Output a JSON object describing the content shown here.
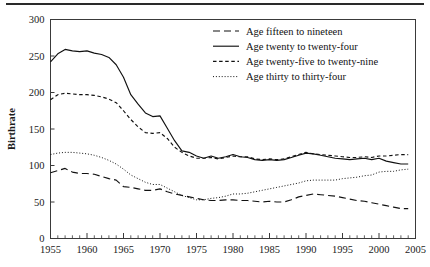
{
  "chart_data": {
    "type": "line",
    "title": "",
    "xlabel": "",
    "ylabel": "Birthrate",
    "xlim": [
      1955,
      2005
    ],
    "ylim": [
      0,
      300
    ],
    "yticks": [
      0,
      50,
      100,
      150,
      200,
      250,
      300
    ],
    "xticks": [
      1955,
      1960,
      1965,
      1970,
      1975,
      1980,
      1985,
      1990,
      1995,
      2000,
      2005
    ],
    "xtick_labels": [
      "1955",
      "1960",
      "1965",
      "1970",
      "1975",
      "1980",
      "1985",
      "1990",
      "1995",
      "2000",
      "2005"
    ],
    "ytick_labels": [
      "0",
      "50",
      "100",
      "150",
      "200",
      "250",
      "300"
    ],
    "minor_xtick_interval": 1,
    "grid": false,
    "legend_position": "top-right",
    "x": [
      1955,
      1956,
      1957,
      1958,
      1959,
      1960,
      1961,
      1962,
      1963,
      1964,
      1965,
      1966,
      1967,
      1968,
      1969,
      1970,
      1971,
      1972,
      1973,
      1974,
      1975,
      1976,
      1977,
      1978,
      1979,
      1980,
      1981,
      1982,
      1983,
      1984,
      1985,
      1986,
      1987,
      1988,
      1989,
      1990,
      1991,
      1992,
      1993,
      1994,
      1995,
      1996,
      1997,
      1998,
      1999,
      2000,
      2001,
      2002,
      2003,
      2004
    ],
    "series": [
      {
        "name": "Age fifteen to nineteen",
        "style": "long-dash",
        "values": [
          90,
          93,
          96,
          91,
          89,
          89,
          88,
          85,
          82,
          80,
          71,
          70,
          68,
          66,
          66,
          68,
          64,
          61,
          59,
          57,
          55,
          53,
          52,
          52,
          53,
          53,
          52,
          52,
          51,
          50,
          51,
          50,
          50,
          53,
          57,
          59,
          61,
          60,
          59,
          58,
          56,
          54,
          52,
          51,
          49,
          47,
          45,
          43,
          41,
          41
        ]
      },
      {
        "name": "Age twenty to twenty-four",
        "style": "solid",
        "values": [
          242,
          253,
          259,
          257,
          256,
          257,
          254,
          252,
          248,
          238,
          221,
          197,
          184,
          172,
          167,
          168,
          151,
          134,
          120,
          118,
          113,
          110,
          113,
          110,
          112,
          115,
          112,
          111,
          108,
          107,
          108,
          107,
          108,
          111,
          114,
          117,
          116,
          114,
          112,
          110,
          109,
          108,
          109,
          110,
          108,
          110,
          106,
          104,
          102,
          102
        ]
      },
      {
        "name": "Age twenty-five to twenty-nine",
        "style": "short-dash",
        "values": [
          190,
          197,
          199,
          198,
          197,
          197,
          196,
          194,
          191,
          186,
          175,
          163,
          153,
          145,
          144,
          145,
          137,
          125,
          118,
          113,
          110,
          110,
          111,
          109,
          111,
          113,
          112,
          112,
          109,
          108,
          109,
          108,
          109,
          112,
          115,
          118,
          116,
          115,
          114,
          113,
          112,
          111,
          111,
          112,
          111,
          113,
          113,
          114,
          115,
          115
        ]
      },
      {
        "name": "Age thirty to thirty-four",
        "style": "dotted",
        "values": [
          115,
          117,
          118,
          118,
          117,
          116,
          114,
          111,
          107,
          102,
          95,
          87,
          82,
          77,
          74,
          74,
          69,
          64,
          59,
          56,
          53,
          53,
          55,
          56,
          58,
          61,
          61,
          62,
          64,
          66,
          68,
          70,
          72,
          74,
          76,
          79,
          80,
          80,
          80,
          80,
          82,
          83,
          84,
          86,
          87,
          91,
          92,
          92,
          94,
          95
        ]
      }
    ]
  },
  "legend": {
    "items": [
      {
        "label": "Age fifteen to nineteen",
        "style": "long-dash"
      },
      {
        "label": "Age twenty to twenty-four",
        "style": "solid"
      },
      {
        "label": "Age twenty-five to twenty-nine",
        "style": "short-dash"
      },
      {
        "label": "Age thirty to thirty-four",
        "style": "dotted"
      }
    ]
  }
}
